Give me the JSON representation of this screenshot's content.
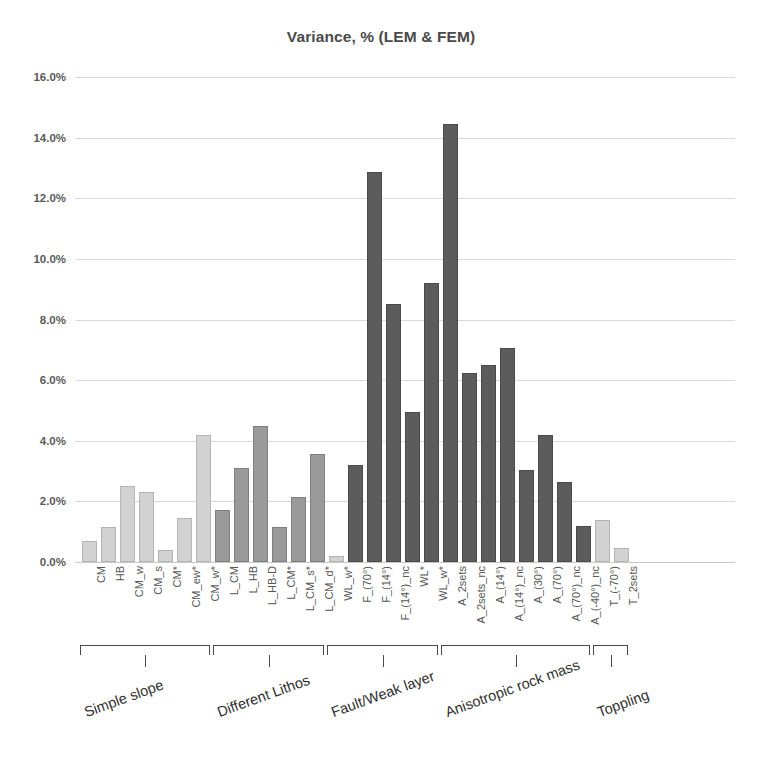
{
  "chart": {
    "title": "Variance, % (LEM & FEM)",
    "type": "bar"
  },
  "chart_data": {
    "type": "bar",
    "title": "Variance, % (LEM & FEM)",
    "xlabel": "",
    "ylabel": "",
    "ylim": [
      0,
      16
    ],
    "yticks": [
      "0.0%",
      "2.0%",
      "4.0%",
      "6.0%",
      "8.0%",
      "10.0%",
      "12.0%",
      "14.0%",
      "16.0%"
    ],
    "ytick_values": [
      0,
      2,
      4,
      6,
      8,
      10,
      12,
      14,
      16
    ],
    "grid": true,
    "legend": "none",
    "value_unit": "%",
    "categories": [
      "CM",
      "HB",
      "CM_w",
      "CM_s",
      "CM*",
      "CM_ew*",
      "CM_w*",
      "L_CM",
      "L_HB",
      "L_HB-D",
      "L_CM*",
      "L_CM_s*",
      "L_CM_d*",
      "WL_w*",
      "F_(70°)",
      "F_(14°)",
      "F_(14°)_nc",
      "WL*",
      "WL_w*",
      "A_2sets",
      "A_2sets_nc",
      "A_(14°)",
      "A_(14°)_nc",
      "A_(30°)",
      "A_(70°)",
      "A_(70°)_nc",
      "A_(-40°)_nc",
      "T_(-70°)",
      "T_2sets"
    ],
    "values": [
      0.7,
      1.15,
      2.5,
      2.3,
      0.4,
      1.45,
      4.2,
      1.7,
      3.1,
      4.5,
      1.15,
      2.15,
      3.55,
      0.2,
      3.2,
      12.85,
      8.5,
      4.95,
      9.2,
      14.45,
      6.25,
      6.5,
      7.05,
      3.05,
      4.2,
      2.65,
      1.2,
      1.4,
      0.45
    ],
    "shades": [
      "light",
      "light",
      "light",
      "light",
      "light",
      "light",
      "light",
      "mid",
      "mid",
      "mid",
      "mid",
      "mid",
      "mid",
      "light",
      "dark",
      "dark",
      "dark",
      "dark",
      "dark",
      "dark",
      "dark",
      "dark",
      "dark",
      "dark",
      "dark",
      "dark",
      "dark",
      "light",
      "light"
    ],
    "groups": [
      {
        "label": "Simple slope",
        "start": 0,
        "end": 6
      },
      {
        "label": "Different Lithos",
        "start": 7,
        "end": 12
      },
      {
        "label": "Fault/Weak layer",
        "start": 13,
        "end": 18
      },
      {
        "label": "Anisotropic rock mass",
        "start": 19,
        "end": 26
      },
      {
        "label": "Toppling",
        "start": 27,
        "end": 28
      }
    ],
    "colors": {
      "bar_light": "#d2d2d2",
      "bar_mid": "#9a9a9a",
      "bar_dark": "#5c5c5c",
      "gridline": "#d9d9d9",
      "text": "#565656",
      "title": "#4a4a4a"
    }
  }
}
